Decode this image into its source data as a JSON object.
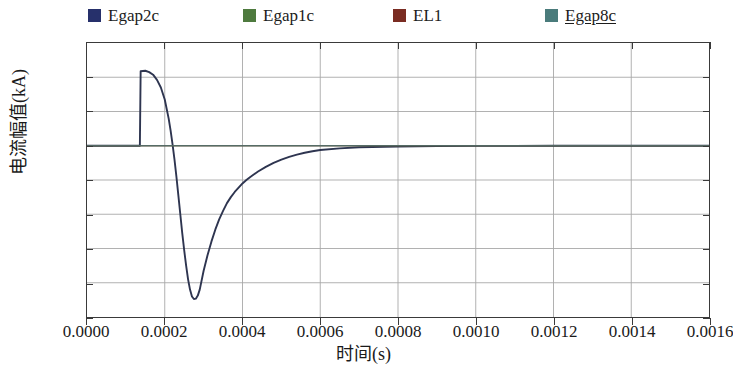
{
  "legend": {
    "position": "top",
    "items": [
      {
        "label": "Egap2c",
        "color": "#26306b",
        "underlined": false,
        "x": 88
      },
      {
        "label": "Egap1c",
        "color": "#4e7a3e",
        "underlined": false,
        "x": 243
      },
      {
        "label": "EL1",
        "color": "#7a2c22",
        "underlined": false,
        "x": 393
      },
      {
        "label": "Egap8c",
        "color": "#4a7b7b",
        "underlined": true,
        "x": 545
      }
    ]
  },
  "axes": {
    "x": {
      "title": "时间(s)",
      "ticks": [
        "0.0000",
        "0.0002",
        "0.0004",
        "0.0006",
        "0.0008",
        "0.0010",
        "0.0012",
        "0.0014",
        "0.0016"
      ],
      "min": 0.0,
      "max": 0.0016
    },
    "y": {
      "title": "电流幅值(kA)",
      "ticks": [
        "60",
        "40",
        "20",
        "0",
        "-20",
        "-40",
        "-60",
        "-80",
        "-100"
      ],
      "min": -100,
      "max": 60
    }
  },
  "style": {
    "curve_color": "#2e3550",
    "grid_color": "#a8a8a8",
    "frame_color": "#3a3a3a",
    "background": "#ffffff"
  },
  "chart_data": {
    "type": "line",
    "title": "",
    "xlabel": "时间(s)",
    "ylabel": "电流幅值(kA)",
    "xlim": [
      0.0,
      0.0016
    ],
    "ylim": [
      -100,
      60
    ],
    "xticks": [
      0.0,
      0.0002,
      0.0004,
      0.0006,
      0.0008,
      0.001,
      0.0012,
      0.0014,
      0.0016
    ],
    "yticks": [
      60,
      40,
      20,
      0,
      -20,
      -40,
      -60,
      -80,
      -100
    ],
    "grid": true,
    "legend_position": "top",
    "series": [
      {
        "name": "Egap2c",
        "color": "#26306b",
        "x": [
          0.0,
          2e-05,
          4e-05,
          6e-05,
          8e-05,
          0.0001,
          0.00012,
          0.000136,
          0.000138,
          0.00015,
          0.00016,
          0.00017,
          0.00018,
          0.00019,
          0.0002,
          0.00021,
          0.000215,
          0.00022,
          0.000225,
          0.00023,
          0.000235,
          0.00024,
          0.000245,
          0.00025,
          0.000255,
          0.00026,
          0.000265,
          0.00027,
          0.000275,
          0.00028,
          0.000285,
          0.00029,
          0.0003,
          0.00031,
          0.00032,
          0.00033,
          0.00034,
          0.00035,
          0.00036,
          0.00037,
          0.00038,
          0.00039,
          0.0004,
          0.00041,
          0.00042,
          0.00044,
          0.00046,
          0.00048,
          0.0005,
          0.00052,
          0.00054,
          0.00056,
          0.00058,
          0.0006,
          0.00065,
          0.0007,
          0.0008,
          0.0009,
          0.001,
          0.0011,
          0.0012,
          0.0013,
          0.0014,
          0.0015,
          0.0016
        ],
        "y": [
          0,
          0,
          0,
          0,
          0,
          0,
          0,
          0,
          43.5,
          43.8,
          43.0,
          41.5,
          38.5,
          34.0,
          27.0,
          16.0,
          9.0,
          1.0,
          -8.0,
          -18.0,
          -29.0,
          -40.0,
          -51.0,
          -61.0,
          -70.0,
          -78.0,
          -84.0,
          -88.0,
          -89.5,
          -89.3,
          -87.5,
          -84.0,
          -73.0,
          -64.0,
          -56.0,
          -49.0,
          -43.0,
          -38.0,
          -33.5,
          -30.0,
          -27.0,
          -24.5,
          -22.0,
          -20.0,
          -18.2,
          -15.0,
          -12.3,
          -10.0,
          -8.1,
          -6.5,
          -5.2,
          -4.1,
          -3.2,
          -2.5,
          -1.5,
          -0.9,
          -0.4,
          -0.2,
          -0.1,
          -0.05,
          0.0,
          0.0,
          0.0,
          0.0,
          0.0
        ]
      },
      {
        "name": "Egap1c",
        "color": "#4e7a3e",
        "note": "overlaps Egap2c",
        "x": [
          0.0,
          0.0016
        ],
        "y": [
          0,
          0
        ]
      },
      {
        "name": "EL1",
        "color": "#7a2c22",
        "note": "overlaps Egap2c",
        "x": [
          0.0,
          0.0016
        ],
        "y": [
          0,
          0
        ]
      },
      {
        "name": "Egap8c",
        "color": "#4a7b7b",
        "note": "overlaps Egap2c",
        "x": [
          0.0,
          0.0016
        ],
        "y": [
          0,
          0
        ]
      }
    ]
  }
}
